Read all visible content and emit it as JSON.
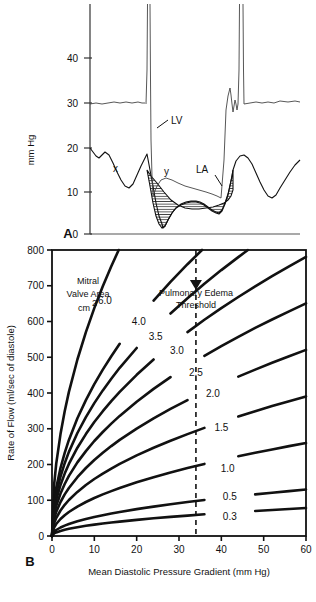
{
  "figure": {
    "panelA": {
      "label": "A",
      "yaxis_title": "mm Hg",
      "yticks": [
        40,
        30,
        20,
        10,
        0
      ],
      "traces": [
        {
          "name": "LV",
          "label": "LV"
        },
        {
          "name": "LA",
          "label": "LA"
        }
      ],
      "wave_labels": [
        {
          "name": "x-descent",
          "label": "x"
        },
        {
          "name": "y-descent",
          "label": "y"
        }
      ],
      "shaded_region_note": "diastolic mitral pressure gradient (hatched)"
    },
    "panelB": {
      "label": "B",
      "legend_title_line1": "Mitral",
      "legend_title_line2": "Valve Area",
      "legend_title_line3": "cm",
      "legend_title_sup": "2",
      "threshold_line1": "Pulmonary Edema",
      "threshold_line2": "Threshold",
      "threshold_x": 34
    }
  },
  "chart_data": {
    "type": "line",
    "title": "",
    "xlabel": "Mean Diastolic Pressure Gradient (mm Hg)",
    "ylabel": "Rate of Flow (ml/sec of diastole)",
    "xlim": [
      0,
      60
    ],
    "ylim": [
      0,
      800
    ],
    "xticks": [
      0,
      10,
      20,
      30,
      40,
      50,
      60
    ],
    "yticks": [
      0,
      100,
      200,
      300,
      400,
      500,
      600,
      700,
      800
    ],
    "grid": false,
    "legend": "inline curve labels",
    "annotations": [
      {
        "text": "Mitral Valve Area cm2",
        "x": 9,
        "y": 720
      },
      {
        "text": "Pulmonary Edema Threshold",
        "x": 34,
        "y": 700
      }
    ],
    "threshold_line": {
      "type": "vertical-dashed",
      "x": 34,
      "label": "Pulmonary Edema Threshold"
    },
    "series": [
      {
        "name": "6.0",
        "label": "6.0",
        "area": 6.0,
        "k": 201.6,
        "label_x": 12.5,
        "label_y": 660
      },
      {
        "name": "4.0",
        "label": "4.0",
        "area": 4.0,
        "k": 134.4,
        "label_x": 20.5,
        "label_y": 600
      },
      {
        "name": "3.5",
        "label": "3.5",
        "area": 3.5,
        "k": 117.6,
        "label_x": 24.5,
        "label_y": 558
      },
      {
        "name": "3.0",
        "label": "3.0",
        "area": 3.0,
        "k": 100.8,
        "label_x": 29.5,
        "label_y": 518
      },
      {
        "name": "2.5",
        "label": "2.5",
        "area": 2.5,
        "k": 84.0,
        "label_x": 34.0,
        "label_y": 458
      },
      {
        "name": "2.0",
        "label": "2.0",
        "area": 2.0,
        "k": 67.2,
        "label_x": 38.0,
        "label_y": 400
      },
      {
        "name": "1.5",
        "label": "1.5",
        "area": 1.5,
        "k": 50.4,
        "label_x": 40.0,
        "label_y": 303
      },
      {
        "name": "1.0",
        "label": "1.0",
        "area": 1.0,
        "k": 33.6,
        "label_x": 41.5,
        "label_y": 190
      },
      {
        "name": "0.5",
        "label": "0.5",
        "area": 0.5,
        "k": 16.8,
        "label_x": 42.0,
        "label_y": 110
      },
      {
        "name": "0.3",
        "label": "0.3",
        "area": 0.3,
        "k": 10.1,
        "label_x": 42.0,
        "label_y": 55
      }
    ],
    "x_sample": [
      0,
      0.5,
      1,
      2,
      3,
      4,
      6,
      8,
      10,
      12,
      14,
      16,
      20,
      24,
      28,
      32,
      36,
      40,
      44,
      48,
      52,
      56,
      60
    ]
  }
}
